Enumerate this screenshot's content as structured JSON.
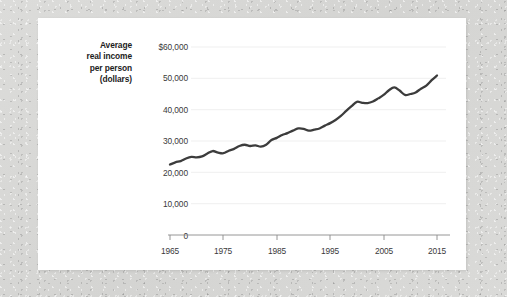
{
  "figure": {
    "y_axis_title_lines": [
      "Average",
      "real income",
      "per person",
      "(dollars)"
    ],
    "y_tick_labels": [
      "$60,000",
      "50,000",
      "40,000",
      "30,000",
      "20,000",
      "10,000",
      "0"
    ],
    "x_tick_labels": [
      "1965",
      "1975",
      "1985",
      "1995",
      "2005",
      "2015"
    ],
    "line_color": "#3c3c3c",
    "gridline_color": "#efefef",
    "axis_color": "#8a8a8a",
    "card_color": "#ffffff",
    "background_color": "#d8d8d6"
  },
  "chart_data": {
    "type": "line",
    "title": "",
    "subtitle": "",
    "xlabel": "",
    "ylabel": "Average real income per person (dollars)",
    "xlim": [
      1965,
      2015
    ],
    "ylim": [
      0,
      60000
    ],
    "ytick_values": [
      0,
      10000,
      20000,
      30000,
      40000,
      50000,
      60000
    ],
    "xtick_values": [
      1965,
      1975,
      1985,
      1995,
      2005,
      2015
    ],
    "grid": "horizontal",
    "legend": "none",
    "series": [
      {
        "name": "Average real income per person",
        "x": [
          1965,
          1966,
          1967,
          1968,
          1969,
          1970,
          1971,
          1972,
          1973,
          1974,
          1975,
          1976,
          1977,
          1978,
          1979,
          1980,
          1981,
          1982,
          1983,
          1984,
          1985,
          1986,
          1987,
          1988,
          1989,
          1990,
          1991,
          1992,
          1993,
          1994,
          1995,
          1996,
          1997,
          1998,
          1999,
          2000,
          2001,
          2002,
          2003,
          2004,
          2005,
          2006,
          2007,
          2008,
          2009,
          2010,
          2011,
          2012,
          2013,
          2014,
          2015
        ],
        "values": [
          22500,
          23200,
          23600,
          24400,
          24900,
          24800,
          25100,
          26000,
          26800,
          26300,
          26100,
          26900,
          27500,
          28400,
          28800,
          28400,
          28600,
          28200,
          28800,
          30300,
          31000,
          31900,
          32500,
          33300,
          34000,
          33900,
          33300,
          33600,
          34000,
          34900,
          35700,
          36700,
          38000,
          39600,
          41100,
          42500,
          42200,
          42100,
          42600,
          43600,
          44700,
          46200,
          47100,
          46100,
          44700,
          45000,
          45500,
          46700,
          47700,
          49400,
          50900
        ]
      }
    ],
    "annotations": []
  }
}
